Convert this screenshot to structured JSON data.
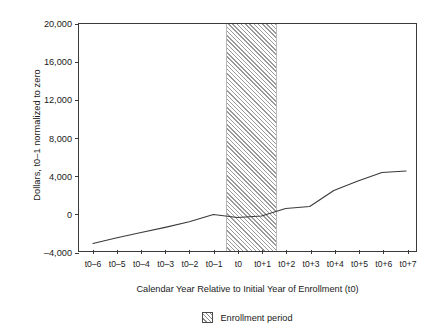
{
  "chart_data": {
    "type": "line",
    "title": "",
    "subtitle": "",
    "xlabel": "Calendar Year Relative to Initial Year of Enrollment (t0)",
    "ylabel": "Dollars, t0–1 normalized to zero",
    "categories": [
      "t0–6",
      "t0–5",
      "t0–4",
      "t0–3",
      "t0–2",
      "t0–1",
      "t0",
      "t0+1",
      "t0+2",
      "t0+3",
      "t0+4",
      "t0+5",
      "t0+6",
      "t0+7"
    ],
    "xtick_labels": [
      "t0–6",
      "t0–5",
      "t0–4",
      "t0–3",
      "t0–2",
      "t0–1",
      "t0",
      "t0+1",
      "t0+2",
      "t0+3",
      "t0+4",
      "t0+5",
      "t0+6",
      "t0+7"
    ],
    "ytick_labels": [
      "20,000",
      "16,000",
      "12,000",
      "8,000",
      "4,000",
      "0",
      "–4,000"
    ],
    "ytick_values": [
      20000,
      16000,
      12000,
      8000,
      4000,
      0,
      -4000
    ],
    "ylim": [
      -4000,
      20000
    ],
    "grid": false,
    "legend_position": "bottom-center",
    "series": [
      {
        "name": "Dollars normalized to zero at t0–1",
        "values": [
          -3200,
          -2600,
          -2050,
          -1500,
          -900,
          -150,
          -450,
          -300,
          500,
          700,
          2400,
          3400,
          4300,
          4450
        ]
      }
    ],
    "annotations": [
      {
        "name": "Enrollment period",
        "type": "shaded-band",
        "x_start": "t0–0.5",
        "x_end": "t0+1.5",
        "pattern": "diagonal-hatch"
      }
    ],
    "legend": [
      {
        "label": "Enrollment period",
        "pattern": "diagonal-hatch"
      }
    ]
  }
}
